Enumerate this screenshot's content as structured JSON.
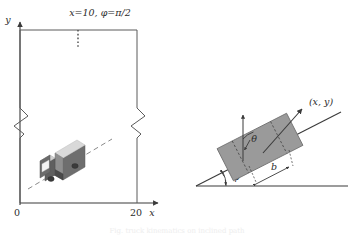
{
  "figure": {
    "background_color": "#ffffff",
    "line_color": "#3a3a3a",
    "dash_color": "#7a7a7a",
    "caption_faint": "Fig. truck kinematics on inclined path"
  },
  "left_panel": {
    "name": "road-region-plot",
    "top_label": "x=10, φ=π/2",
    "y_axis_label": "y",
    "x_axis_label": "x",
    "x_tick_origin": "0",
    "x_tick_right": "20",
    "dotted_marker_x_value": 10,
    "box": {
      "left_x": 20,
      "right_x": 137,
      "top_y": 30,
      "bottom_y": 203,
      "break_mark_y": 122
    },
    "trajectory": {
      "name": "truck-path-dashed-line",
      "x1": 28,
      "y1": 188,
      "x2": 110,
      "y2": 140,
      "style": "dashed"
    },
    "vehicle": {
      "name": "truck-illustration",
      "type": "box-truck",
      "center_x": 70,
      "center_y": 163,
      "body_color": "#6e6e6e",
      "roof_color": "#d6d6d6",
      "cab_color": "#4a4a4a",
      "window_color": "#f2f2f2",
      "wheel_color": "#3b3b3b"
    }
  },
  "right_panel": {
    "name": "orientation-detail-plot",
    "ground_label": "",
    "incline_angle_label": "φ",
    "heading_angle_label": "θ",
    "position_label": "(x, y)",
    "width_dimension_label": "b",
    "ground_line": {
      "x1": 196,
      "y1": 186,
      "x2": 348,
      "y2": 186
    },
    "incline_line": {
      "x1": 196,
      "y1": 186,
      "x2": 340,
      "y2": 112
    },
    "body_rect": {
      "center_x": 260,
      "center_y": 147,
      "length": 78,
      "width": 36,
      "rotation_deg": -27,
      "fill": "#9a9a9a",
      "stroke": "#6a6a6a"
    },
    "heading_arrow": {
      "x1": 262,
      "y1": 152,
      "x2": 300,
      "y2": 110
    },
    "vertical_arrow": {
      "x1": 243,
      "y1": 160,
      "x2": 243,
      "y2": 116
    }
  }
}
